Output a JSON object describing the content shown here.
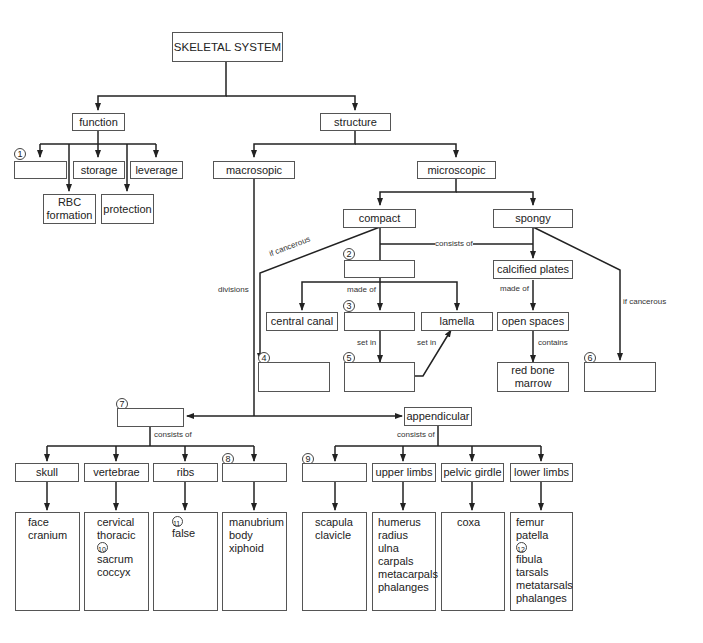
{
  "root": "SKELETAL SYSTEM",
  "function": {
    "label": "function",
    "children": [
      "",
      "storage",
      "leverage",
      "RBC formation",
      "protection"
    ],
    "blank_number": "1"
  },
  "structure": {
    "label": "structure",
    "macroscopic": "macrosopic",
    "microscopic": "microscopic",
    "compact": "compact",
    "spongy": "spongy",
    "consists_of": "consists of",
    "made_of": "made of",
    "set_in": "set in",
    "contains": "contains",
    "if_cancerous": "if cancerous",
    "divisions": "divisions",
    "central_canal": "central canal",
    "lamella": "lamella",
    "calcified_plates": "calcified plates",
    "open_spaces": "open spaces",
    "red_bone_marrow": "red bone marrow"
  },
  "numbers": [
    "1",
    "2",
    "3",
    "4",
    "5",
    "6",
    "7",
    "8",
    "9",
    "10",
    "11",
    "12"
  ],
  "axial": {
    "consists_of": "consists of",
    "parts": [
      {
        "label": "skull",
        "items": [
          "face",
          "cranium"
        ]
      },
      {
        "label": "vertebrae",
        "items": [
          "cervical",
          "thoracic",
          "⑩",
          "sacrum",
          "coccyx"
        ]
      },
      {
        "label": "ribs",
        "items": [
          "⑪",
          "false"
        ]
      },
      {
        "label": "",
        "items": [
          "manubrium",
          "body",
          "xiphoid"
        ]
      }
    ]
  },
  "appendicular": {
    "label": "appendicular",
    "consists_of": "consists of",
    "parts": [
      {
        "label": "",
        "items": [
          "scapula",
          "clavicle"
        ]
      },
      {
        "label": "upper limbs",
        "items": [
          "humerus",
          "radius",
          "ulna",
          "carpals",
          "metacarpals",
          "phalanges"
        ]
      },
      {
        "label": "pelvic girdle",
        "items": [
          "coxa"
        ]
      },
      {
        "label": "lower limbs",
        "items": [
          "femur",
          "patella",
          "⑫",
          "fibula",
          "tarsals",
          "metatarsals",
          "phalanges"
        ]
      }
    ]
  }
}
